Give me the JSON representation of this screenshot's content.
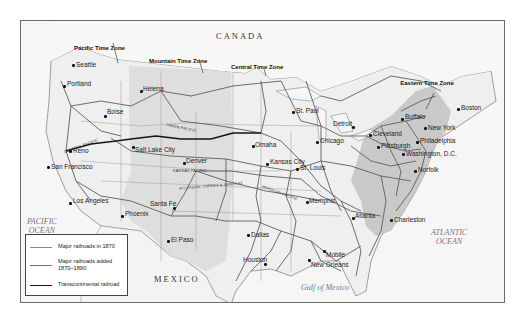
{
  "map": {
    "countries": {
      "north": "CANADA",
      "south": "MEXICO"
    },
    "water": {
      "pacific": "PACIFIC\nOCEAN",
      "atlantic": "ATLANTIC\nOCEAN",
      "gulf": "Gulf of Mexico"
    },
    "time_zones": [
      {
        "label": "Pacific Time Zone"
      },
      {
        "label": "Mountain Time Zone"
      },
      {
        "label": "Central Time Zone"
      },
      {
        "label": "Eastern Time Zone"
      }
    ],
    "cities": [
      {
        "name": "Seattle"
      },
      {
        "name": "Portland"
      },
      {
        "name": "Boise"
      },
      {
        "name": "Helena"
      },
      {
        "name": "Reno"
      },
      {
        "name": "San Francisco"
      },
      {
        "name": "Salt Lake City"
      },
      {
        "name": "Denver"
      },
      {
        "name": "Los Angeles"
      },
      {
        "name": "Phoenix"
      },
      {
        "name": "Santa Fe"
      },
      {
        "name": "El Paso"
      },
      {
        "name": "St. Paul"
      },
      {
        "name": "Omaha"
      },
      {
        "name": "Kansas City"
      },
      {
        "name": "St. Louis"
      },
      {
        "name": "Chicago"
      },
      {
        "name": "Detroit"
      },
      {
        "name": "Cleveland"
      },
      {
        "name": "Buffalo"
      },
      {
        "name": "Pittsburgh"
      },
      {
        "name": "Boston"
      },
      {
        "name": "New York"
      },
      {
        "name": "Philadelphia"
      },
      {
        "name": "Washington, D.C."
      },
      {
        "name": "Norfolk"
      },
      {
        "name": "Memphis"
      },
      {
        "name": "Atlanta"
      },
      {
        "name": "Charleston"
      },
      {
        "name": "Dallas"
      },
      {
        "name": "Houston"
      },
      {
        "name": "New Orleans"
      },
      {
        "name": "Mobile"
      }
    ],
    "railroad_names": {
      "central_pacific": "CENTRAL PACIFIC",
      "union_pacific": "UNION PACIFIC",
      "kansas_pacific": "KANSAS PACIFIC",
      "atchison": "ATCHISON, TOPEKA & SANTA FE",
      "missouri_pacific": "MISSOURI PACIFIC"
    }
  },
  "legend": {
    "items": [
      {
        "label": "Major railroads in 1870",
        "color": "#8a8a8a"
      },
      {
        "label": "Major railroads added 1870–1890",
        "color": "#6e6e6e"
      },
      {
        "label": "Transcontinental railroad",
        "color": "#1a1a1a"
      }
    ]
  },
  "colors": {
    "land": "#f4f4f4",
    "zone_shade": "#d9d9d9",
    "east_shade": "#c4c4c4",
    "rail": "#5c5c5c",
    "transcontinental": "#1a1a1a",
    "border": "#777777"
  }
}
